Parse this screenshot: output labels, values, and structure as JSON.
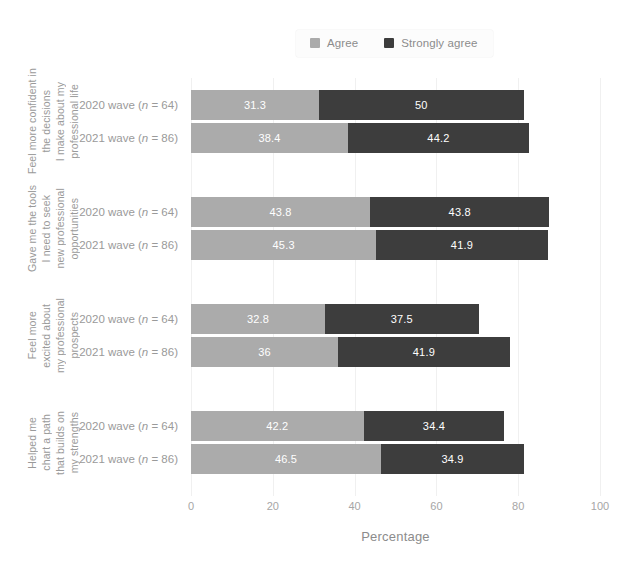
{
  "chart_data": {
    "type": "bar",
    "subtype": "horizontal-stacked",
    "title": "",
    "xlabel": "Percentage",
    "ylabel": "",
    "xlim": [
      0,
      100
    ],
    "xticks": [
      0,
      20,
      40,
      60,
      80,
      100
    ],
    "grid": true,
    "legend_position": "top-center",
    "colors": {
      "agree": "#ababab",
      "strongly_agree": "#3d3d3d",
      "background": "#ffffff",
      "gridline": "#f0f0f0",
      "text": "#9a9a9a",
      "bar_label_text": "#ffffff"
    },
    "series": [
      {
        "name": "Agree",
        "key": "agree"
      },
      {
        "name": "Strongly agree",
        "key": "strongly_agree"
      }
    ],
    "categories": [
      {
        "label_lines": [
          "Feel more confident in",
          "the decisions",
          "I make about my",
          "professional life"
        ],
        "rows": [
          {
            "tick_prefix": "2020 wave (",
            "tick_n": "n",
            "tick_suffix": " = 64)",
            "agree": 31.3,
            "strongly_agree": 50,
            "agree_label": "31.3",
            "strongly_agree_label": "50",
            "total": 81.3
          },
          {
            "tick_prefix": "2021 wave (",
            "tick_n": "n",
            "tick_suffix": " = 86)",
            "agree": 38.4,
            "strongly_agree": 44.2,
            "agree_label": "38.4",
            "strongly_agree_label": "44.2",
            "total": 82.6
          }
        ]
      },
      {
        "label_lines": [
          "Gave me the tools",
          "I need to seek",
          "new professional",
          "opportunities"
        ],
        "rows": [
          {
            "tick_prefix": "2020 wave (",
            "tick_n": "n",
            "tick_suffix": " = 64)",
            "agree": 43.8,
            "strongly_agree": 43.8,
            "agree_label": "43.8",
            "strongly_agree_label": "43.8",
            "total": 87.6
          },
          {
            "tick_prefix": "2021 wave (",
            "tick_n": "n",
            "tick_suffix": " = 86)",
            "agree": 45.3,
            "strongly_agree": 41.9,
            "agree_label": "45.3",
            "strongly_agree_label": "41.9",
            "total": 87.2
          }
        ]
      },
      {
        "label_lines": [
          "Feel more",
          "excited about",
          "my professional",
          "prospects"
        ],
        "rows": [
          {
            "tick_prefix": "2020 wave (",
            "tick_n": "n",
            "tick_suffix": " = 64)",
            "agree": 32.8,
            "strongly_agree": 37.5,
            "agree_label": "32.8",
            "strongly_agree_label": "37.5",
            "total": 70.3
          },
          {
            "tick_prefix": "2021 wave (",
            "tick_n": "n",
            "tick_suffix": " = 86)",
            "agree": 36,
            "strongly_agree": 41.9,
            "agree_label": "36",
            "strongly_agree_label": "41.9",
            "total": 77.9
          }
        ]
      },
      {
        "label_lines": [
          "Helped me",
          "chart a path",
          "that builds on",
          "my strengths"
        ],
        "rows": [
          {
            "tick_prefix": "2020 wave (",
            "tick_n": "n",
            "tick_suffix": " = 64)",
            "agree": 42.2,
            "strongly_agree": 34.4,
            "agree_label": "42.2",
            "strongly_agree_label": "34.4",
            "total": 76.6
          },
          {
            "tick_prefix": "2021 wave (",
            "tick_n": "n",
            "tick_suffix": " = 86)",
            "agree": 46.5,
            "strongly_agree": 34.9,
            "agree_label": "46.5",
            "strongly_agree_label": "34.9",
            "total": 81.4
          }
        ]
      }
    ]
  },
  "legend": {
    "items": [
      {
        "label": "Agree",
        "color": "#ababab"
      },
      {
        "label": "Strongly agree",
        "color": "#3d3d3d"
      }
    ]
  },
  "axis": {
    "x_title": "Percentage",
    "x_ticks": [
      "0",
      "20",
      "40",
      "60",
      "80",
      "100"
    ]
  }
}
